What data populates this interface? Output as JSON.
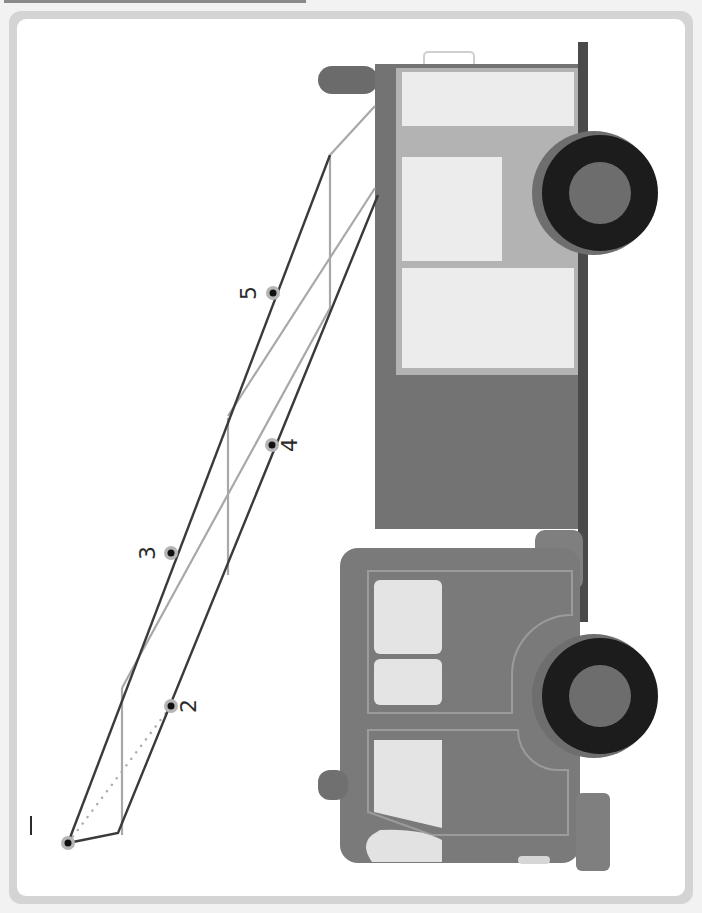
{
  "worksheet": {
    "side_credit": "",
    "dots": [
      {
        "label": "1",
        "x": 68,
        "y": 843
      },
      {
        "label": "2",
        "x": 171,
        "y": 706
      },
      {
        "label": "3",
        "x": 171,
        "y": 553
      },
      {
        "label": "4",
        "x": 272,
        "y": 445
      },
      {
        "label": "5",
        "x": 273,
        "y": 293
      }
    ]
  },
  "colors": {
    "outline": "#3a3a3a",
    "ladder_light": "#a8a8a8",
    "truck_dark": "#6b6b6b",
    "truck_mid": "#8c8c8c",
    "truck_light": "#b5b5b5",
    "window": "#ececec",
    "tire": "#1c1c1c"
  }
}
